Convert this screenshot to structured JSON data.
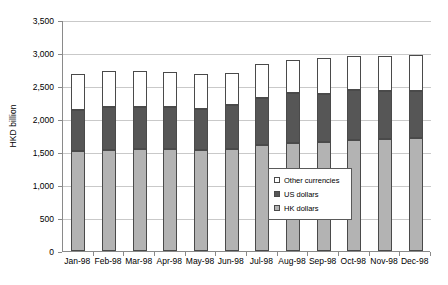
{
  "chart_data": {
    "type": "bar",
    "subtype": "stacked-column",
    "title": "",
    "xlabel": "",
    "ylabel": "HKD billion",
    "ylim": [
      0,
      3500
    ],
    "ytick_step": 500,
    "ytick_labels": [
      "0",
      "500",
      "1,000",
      "1,500",
      "2,000",
      "2,500",
      "3,000",
      "3,500"
    ],
    "ytick_values": [
      0,
      500,
      1000,
      1500,
      2000,
      2500,
      3000,
      3500
    ],
    "grid": "horizontal",
    "legend_position": "inside-center-right",
    "categories": [
      "Jan-98",
      "Feb-98",
      "Mar-98",
      "Apr-98",
      "May-98",
      "Jun-98",
      "Jul-98",
      "Aug-98",
      "Sep-98",
      "Oct-98",
      "Nov-98",
      "Dec-98"
    ],
    "series": [
      {
        "name": "HK dollars",
        "color": "#b3b3b3",
        "values": [
          1510,
          1530,
          1545,
          1550,
          1530,
          1550,
          1600,
          1640,
          1650,
          1680,
          1690,
          1710
        ]
      },
      {
        "name": "US dollars",
        "color": "#565656",
        "values": [
          630,
          645,
          640,
          625,
          615,
          665,
          715,
          750,
          730,
          760,
          740,
          710
        ]
      },
      {
        "name": "Other currencies",
        "color": "#ffffff",
        "values": [
          540,
          545,
          540,
          540,
          535,
          475,
          515,
          500,
          540,
          520,
          520,
          555
        ]
      }
    ],
    "totals": [
      2680,
      2720,
      2725,
      2715,
      2680,
      2690,
      2830,
      2890,
      2920,
      2960,
      2950,
      2975
    ]
  },
  "axis": {
    "y_title": "HKD billion"
  },
  "legend": {
    "items": [
      {
        "label": "Other currencies",
        "swatch": "sw-oth"
      },
      {
        "label": "US dollars",
        "swatch": "sw-usd"
      },
      {
        "label": "HK dollars",
        "swatch": "sw-hkd"
      }
    ]
  }
}
